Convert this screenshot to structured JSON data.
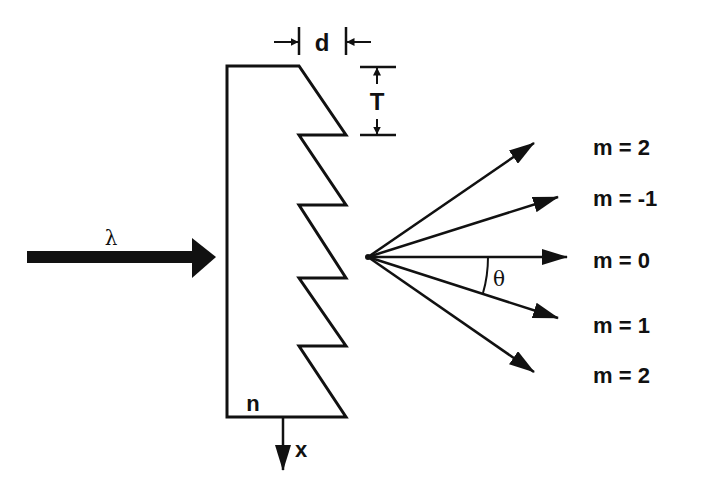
{
  "diagram": {
    "type": "blazed diffraction grating (echelette) cross-section",
    "colors": {
      "ink": "#111111",
      "background": "#ffffff"
    },
    "incident_beam": {
      "label": "λ"
    },
    "grating": {
      "refractive_index_label": "n",
      "period_label": "d",
      "step_height_label": "T",
      "axis_label": "x",
      "teeth_count": 5
    },
    "angle_label": "θ",
    "orders": [
      {
        "label": "m = 2"
      },
      {
        "label": "m = -1"
      },
      {
        "label": "m = 0"
      },
      {
        "label": "m = 1"
      },
      {
        "label": "m = 2"
      }
    ]
  }
}
